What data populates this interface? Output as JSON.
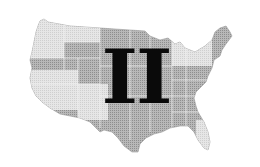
{
  "figure": {
    "numeral": "II",
    "colors": {
      "background": "#ffffff",
      "map_light": "#e4e4e4",
      "map_mid": "#c8c8c8",
      "map_dark": "#a8a8a8",
      "numeral": "#0a0a0a"
    }
  }
}
